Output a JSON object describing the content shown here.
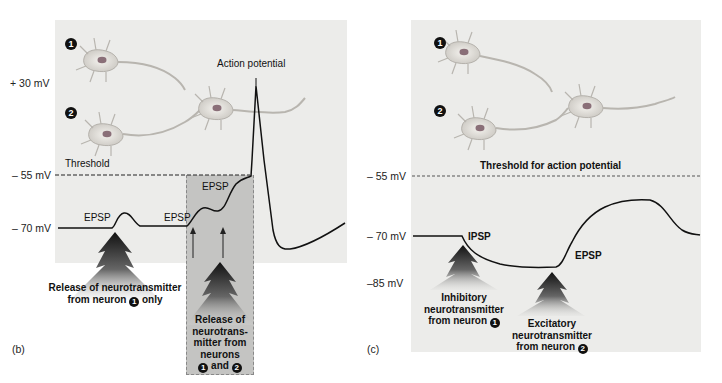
{
  "panel_b": {
    "label": "(b)",
    "axis": {
      "plus30": "+ 30 mV",
      "minus55": "– 55 mV",
      "minus70": "– 70 mV"
    },
    "threshold_label": "Threshold",
    "action_potential_label": "Action potential",
    "epsp_labels": [
      "EPSP",
      "EPSP",
      "EPSP"
    ],
    "release1": {
      "line1": "Release of neurotransmitter",
      "line2_pre": "from neuron",
      "neuron": "1",
      "line2_post": "only"
    },
    "release12": {
      "lines": [
        "Release of",
        "neurotrans-",
        "mitter from",
        "neurons"
      ],
      "neuron_a": "1",
      "and": "and",
      "neuron_b": "2"
    },
    "neuron_markers": [
      "1",
      "2"
    ]
  },
  "panel_c": {
    "label": "(c)",
    "axis": {
      "minus55": "– 55 mV",
      "minus70": "– 70 mV",
      "minus85": "–85 mV"
    },
    "threshold_label": "Threshold for action potential",
    "ipsp_label": "IPSP",
    "epsp_label": "EPSP",
    "inhibitory": {
      "line1": "Inhibitory",
      "line2": "neurotransmitter",
      "line3_pre": "from neuron",
      "neuron": "1"
    },
    "excitatory": {
      "line1": "Excitatory",
      "line2": "neurotransmitter",
      "line3_pre": "from neuron",
      "neuron": "2"
    },
    "neuron_markers": [
      "1",
      "2"
    ]
  },
  "colors": {
    "panel_bg": "#ececea",
    "shaded_box": "#c4c4c2",
    "trace": "#111111",
    "neuron_fill": "#dcdad6",
    "nucleus": "#8a6f78"
  }
}
